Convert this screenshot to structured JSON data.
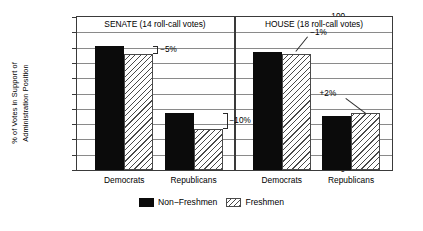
{
  "chart_data": {
    "type": "bar",
    "title": "",
    "xlabel": "",
    "ylabel_line1": "% of Votes in Support of",
    "ylabel_line2": "Administration Position",
    "ylim": [
      0,
      100
    ],
    "ytick_labels": [
      "100",
      "90",
      "80",
      "70",
      "60",
      "50",
      "40",
      "30",
      "20",
      "10",
      "0"
    ],
    "ytick_values": [
      100,
      90,
      80,
      70,
      60,
      50,
      40,
      30,
      20,
      10,
      0
    ],
    "grid": true,
    "legend_position": "bottom-center",
    "panels": [
      {
        "name": "senate",
        "title": "SENATE (14 roll-call votes)",
        "categories": [
          "Democrats",
          "Republicans"
        ],
        "series": [
          {
            "name": "Non-Freshmen",
            "values": [
              81,
              37
            ]
          },
          {
            "name": "Freshmen",
            "values": [
              76,
              27
            ]
          }
        ],
        "annotations": [
          {
            "label": "−5%",
            "category": "Democrats"
          },
          {
            "label": "−10%",
            "category": "Republicans"
          }
        ]
      },
      {
        "name": "house",
        "title": "HOUSE (18 roll-call votes)",
        "categories": [
          "Democrats",
          "Republicans"
        ],
        "series": [
          {
            "name": "Non-Freshmen",
            "values": [
              77,
              35.5
            ]
          },
          {
            "name": "Freshmen",
            "values": [
              76,
              37.5
            ]
          }
        ],
        "annotations": [
          {
            "label": "−1%",
            "category": "Democrats"
          },
          {
            "label": "+2%",
            "category": "Republicans"
          }
        ]
      }
    ],
    "legend": [
      {
        "label": "Non−Freshmen",
        "style": "solid",
        "color": "#0b0b0b"
      },
      {
        "label": "Freshmen",
        "style": "hatched",
        "color": "#4a4a4a"
      }
    ],
    "colors": {
      "non_freshmen": "#0b0b0b",
      "freshmen_hatch": "#4a4a4a",
      "axis": "#3a3a3a",
      "grid": "#8a8a8a",
      "background": "#ffffff"
    }
  }
}
